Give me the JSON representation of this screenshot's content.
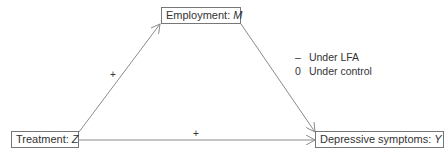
{
  "diagram": {
    "type": "mediation",
    "nodes": {
      "mediator": {
        "label": "Employment: ",
        "var": "M"
      },
      "treatment": {
        "label": "Treatment: ",
        "var": "Z"
      },
      "outcome": {
        "label": "Depressive symptoms: ",
        "var": "Y"
      }
    },
    "edges": {
      "treatment_to_mediator": {
        "sign": "+"
      },
      "treatment_to_outcome": {
        "sign": "+"
      },
      "mediator_to_outcome": {
        "sign": ""
      }
    },
    "legend": [
      {
        "symbol": "–",
        "text": "Under LFA"
      },
      {
        "symbol": "0",
        "text": "Under control"
      }
    ],
    "colors": {
      "line": "#8a8a8a",
      "box_border": "#777777",
      "text": "#333333"
    }
  }
}
